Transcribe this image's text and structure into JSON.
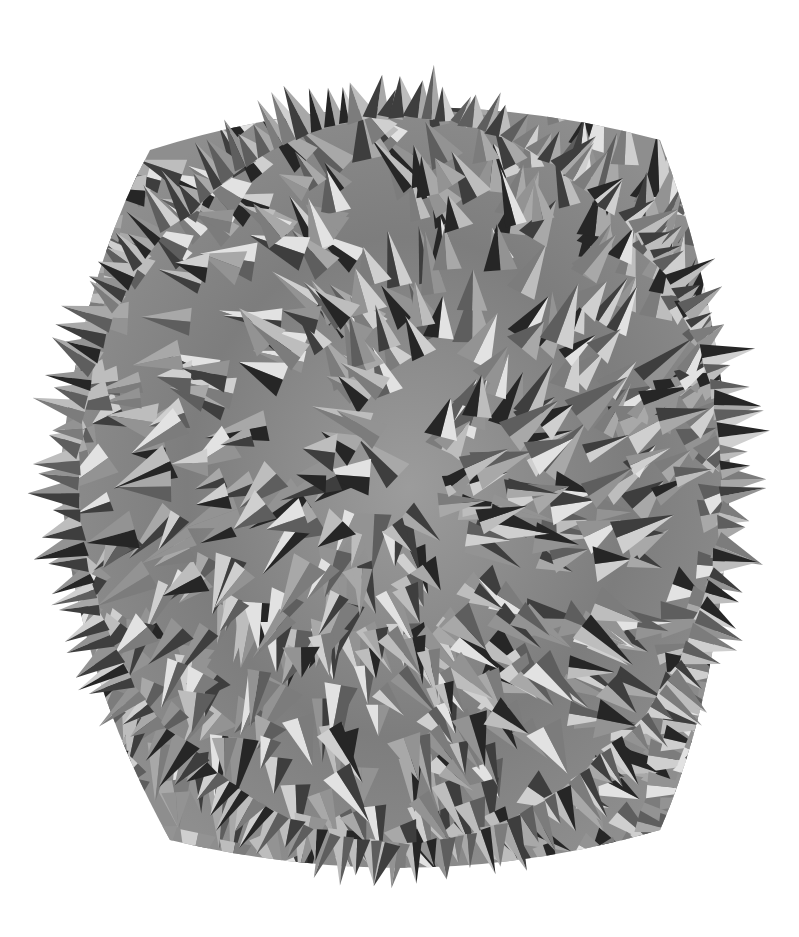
{
  "image": {
    "subject": "Spiky modular origami sculpture",
    "description": "Barrel-shaped sculpture covered in hundreds of folded paper spikes radiating outward, photographed in grayscale on a plain white background",
    "palette": {
      "background": "#ffffff",
      "light_paper": "#c9c9c9",
      "mid_paper": "#9a9a9a",
      "shadow": "#3a3a3a",
      "deep_shadow": "#1a1a1a"
    }
  }
}
